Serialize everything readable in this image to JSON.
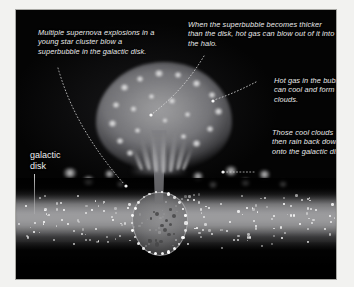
{
  "figure": {
    "panel_background": "#050505",
    "frame_background": "#f2f2f0"
  },
  "captions": {
    "supernova": "Multiple supernova explosions in a young star cluster blow a superbubble in the galactic disk.",
    "blowout": "When the superbubble becomes thicker than the disk, hot gas can blow out of it into the halo.",
    "cooling": "Hot gas in the bubble can cool and form clouds.",
    "rain": "Those cool clouds then rain back down onto the galactic disk."
  },
  "labels": {
    "galactic_disk": "galactic\ndisk"
  },
  "colors": {
    "space": "#040404",
    "disk_band": "#96969a",
    "bubble": "#7a7a7e",
    "cloud_knot": "#f0f0f0",
    "caption_text": "#e9e9e9",
    "leader_line": "#dcdcdc"
  },
  "elements": {
    "superbubble": "superbubble-cap",
    "chimney": "outflow-stem",
    "cavity": "supernova-cavity",
    "halo_clouds": "cooled-cloud-blobs",
    "disk": "galactic-disk-band"
  },
  "stars": [
    {
      "x": 10,
      "y": 196,
      "r": 1.2
    },
    {
      "x": 24,
      "y": 188,
      "r": 0.9
    },
    {
      "x": 33,
      "y": 205,
      "r": 1.3
    },
    {
      "x": 45,
      "y": 193,
      "r": 1.0
    },
    {
      "x": 52,
      "y": 214,
      "r": 1.2
    },
    {
      "x": 62,
      "y": 186,
      "r": 0.9
    },
    {
      "x": 70,
      "y": 203,
      "r": 1.4
    },
    {
      "x": 80,
      "y": 219,
      "r": 1.0
    },
    {
      "x": 88,
      "y": 192,
      "r": 1.1
    },
    {
      "x": 97,
      "y": 210,
      "r": 1.3
    },
    {
      "x": 104,
      "y": 226,
      "r": 0.9
    },
    {
      "x": 112,
      "y": 198,
      "r": 1.2
    },
    {
      "x": 18,
      "y": 222,
      "r": 1.0
    },
    {
      "x": 38,
      "y": 230,
      "r": 1.1
    },
    {
      "x": 58,
      "y": 234,
      "r": 0.9
    },
    {
      "x": 76,
      "y": 200,
      "r": 0.8
    },
    {
      "x": 92,
      "y": 232,
      "r": 1.0
    },
    {
      "x": 28,
      "y": 212,
      "r": 0.8
    },
    {
      "x": 48,
      "y": 200,
      "r": 0.9
    },
    {
      "x": 66,
      "y": 224,
      "r": 1.1
    },
    {
      "x": 178,
      "y": 190,
      "r": 1.2
    },
    {
      "x": 188,
      "y": 207,
      "r": 1.0
    },
    {
      "x": 196,
      "y": 224,
      "r": 1.3
    },
    {
      "x": 205,
      "y": 194,
      "r": 0.9
    },
    {
      "x": 214,
      "y": 212,
      "r": 1.2
    },
    {
      "x": 222,
      "y": 230,
      "r": 1.0
    },
    {
      "x": 231,
      "y": 198,
      "r": 1.1
    },
    {
      "x": 240,
      "y": 216,
      "r": 1.3
    },
    {
      "x": 249,
      "y": 188,
      "r": 0.9
    },
    {
      "x": 258,
      "y": 206,
      "r": 1.2
    },
    {
      "x": 266,
      "y": 228,
      "r": 1.0
    },
    {
      "x": 275,
      "y": 196,
      "r": 1.1
    },
    {
      "x": 284,
      "y": 214,
      "r": 1.2
    },
    {
      "x": 292,
      "y": 232,
      "r": 0.9
    },
    {
      "x": 300,
      "y": 200,
      "r": 1.3
    },
    {
      "x": 309,
      "y": 219,
      "r": 1.0
    },
    {
      "x": 172,
      "y": 234,
      "r": 0.9
    },
    {
      "x": 206,
      "y": 238,
      "r": 0.8
    },
    {
      "x": 246,
      "y": 236,
      "r": 1.0
    },
    {
      "x": 286,
      "y": 190,
      "r": 0.9
    },
    {
      "x": 314,
      "y": 206,
      "r": 1.0
    },
    {
      "x": 160,
      "y": 230,
      "r": 0.9
    },
    {
      "x": 130,
      "y": 236,
      "r": 0.8
    },
    {
      "x": 268,
      "y": 194,
      "r": 0.8
    },
    {
      "x": 226,
      "y": 186,
      "r": 0.8
    },
    {
      "x": 150,
      "y": 192,
      "r": 0.9
    }
  ],
  "halo_clouds": [
    {
      "x": 46,
      "y": 158,
      "w": 16,
      "h": 10
    },
    {
      "x": 66,
      "y": 166,
      "w": 13,
      "h": 9
    },
    {
      "x": 88,
      "y": 160,
      "w": 11,
      "h": 8
    },
    {
      "x": 100,
      "y": 170,
      "w": 9,
      "h": 7
    },
    {
      "x": 176,
      "y": 162,
      "w": 12,
      "h": 9
    },
    {
      "x": 192,
      "y": 170,
      "w": 10,
      "h": 8
    },
    {
      "x": 208,
      "y": 156,
      "w": 14,
      "h": 10
    },
    {
      "x": 224,
      "y": 168,
      "w": 11,
      "h": 8
    },
    {
      "x": 242,
      "y": 160,
      "w": 13,
      "h": 9
    },
    {
      "x": 262,
      "y": 170,
      "w": 10,
      "h": 7
    }
  ],
  "bubble_knots": [
    {
      "x": 104,
      "y": 74,
      "w": 9,
      "h": 7
    },
    {
      "x": 120,
      "y": 66,
      "w": 8,
      "h": 6
    },
    {
      "x": 138,
      "y": 60,
      "w": 10,
      "h": 7
    },
    {
      "x": 158,
      "y": 62,
      "w": 8,
      "h": 6
    },
    {
      "x": 176,
      "y": 70,
      "w": 9,
      "h": 7
    },
    {
      "x": 192,
      "y": 82,
      "w": 8,
      "h": 6
    },
    {
      "x": 198,
      "y": 98,
      "w": 9,
      "h": 7
    },
    {
      "x": 190,
      "y": 116,
      "w": 8,
      "h": 6
    },
    {
      "x": 176,
      "y": 130,
      "w": 9,
      "h": 7
    },
    {
      "x": 96,
      "y": 92,
      "w": 8,
      "h": 6
    },
    {
      "x": 92,
      "y": 110,
      "w": 9,
      "h": 7
    },
    {
      "x": 100,
      "y": 128,
      "w": 8,
      "h": 6
    },
    {
      "x": 114,
      "y": 96,
      "w": 7,
      "h": 6
    },
    {
      "x": 132,
      "y": 84,
      "w": 7,
      "h": 5
    },
    {
      "x": 152,
      "y": 88,
      "w": 8,
      "h": 6
    },
    {
      "x": 168,
      "y": 102,
      "w": 7,
      "h": 5
    },
    {
      "x": 146,
      "y": 108,
      "w": 6,
      "h": 5
    },
    {
      "x": 118,
      "y": 118,
      "w": 7,
      "h": 5
    },
    {
      "x": 164,
      "y": 124,
      "w": 7,
      "h": 5
    },
    {
      "x": 110,
      "y": 140,
      "w": 8,
      "h": 6
    }
  ]
}
